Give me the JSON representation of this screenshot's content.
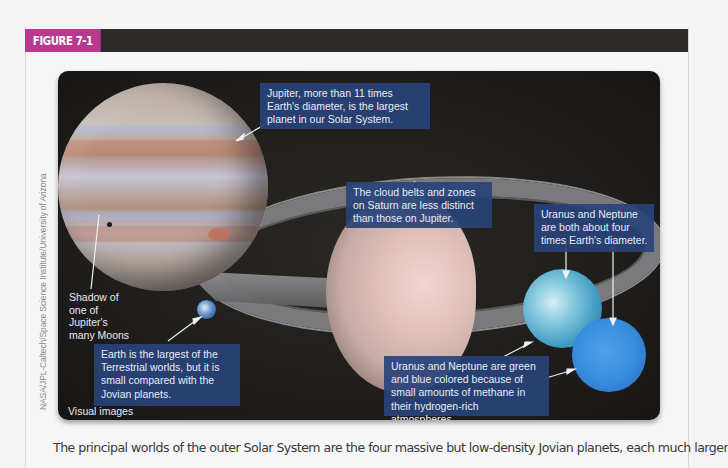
{
  "figure": {
    "tag": "FIGURE 7-1",
    "tag_color": "#b9398f",
    "header_bar_color": "#2e2c2a"
  },
  "image": {
    "credit": "NASA/JPL-Caltech/Space Science Institute/University of Arizona",
    "corner_label": "Visual images",
    "planets": [
      "Jupiter",
      "Saturn",
      "Earth",
      "Uranus",
      "Neptune"
    ]
  },
  "callouts": {
    "jupiter": "Jupiter, more than 11 times Earth's diameter, is the largest planet in our Solar System.",
    "saturn": "The cloud belts and zones on Saturn are less distinct than those on Jupiter.",
    "uranus_neptune_size": "Uranus and Neptune are both about four times Earth's diameter.",
    "uranus_neptune_color": "Uranus and Neptune are green and blue colored because of small amounts of methane in their hydrogen-rich atmospheres.",
    "earth": "Earth is the largest of the Terrestrial worlds, but it is small compared with the Jovian planets.",
    "moon_shadow": "Shadow of one of Jupiter's many Moons",
    "callout_bg": "#284278"
  },
  "caption": {
    "text": "The principal worlds of the outer Solar System are the four massive but low-density Jovian planets, each much larger"
  }
}
